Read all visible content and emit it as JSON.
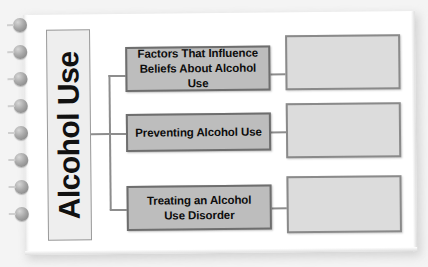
{
  "worksheet": {
    "title": "Alcohol Use",
    "binding": {
      "rivet_count": 8
    },
    "colors": {
      "page": "#ffffff",
      "node_fill": "#bdbdbd",
      "node_border": "#6e6e6e",
      "blank_fill": "#dcdcdc",
      "blank_border": "#8a8a8a",
      "title_fill": "#eeeeee",
      "title_border": "#9a9a9a",
      "connector": "#8d8d8d",
      "text": "#0d0d0d"
    },
    "branches": [
      {
        "label": "Factors That Influence Beliefs About Alcohol Use",
        "line1": "Factors That Influence",
        "line2": "Beliefs About Alcohol Use",
        "answer": ""
      },
      {
        "label": "Preventing Alcohol Use",
        "line1": "Preventing Alcohol Use",
        "line2": "",
        "answer": ""
      },
      {
        "label": "Treating an Alcohol Use Disorder",
        "line1": "Treating an Alcohol",
        "line2": "Use Disorder",
        "answer": ""
      }
    ]
  }
}
